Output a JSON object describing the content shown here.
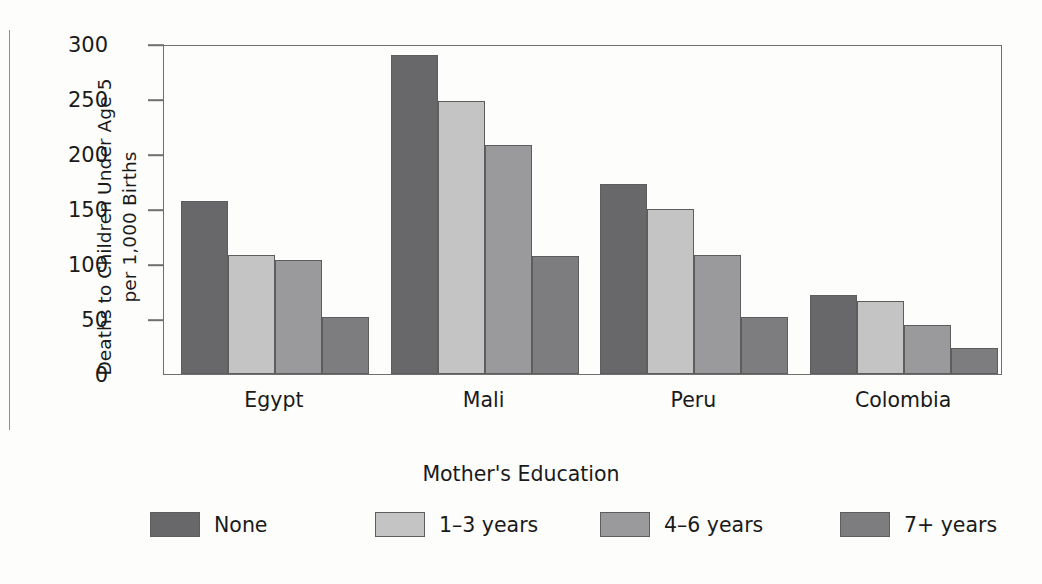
{
  "chart_data": {
    "type": "bar",
    "title": "",
    "xlabel": "Mother's Education",
    "ylabel": "Deaths to Children Under Age 5 per 1,000 Births",
    "ylabel_lines": [
      "Deaths to Children Under Age 5",
      "per 1,000 Births"
    ],
    "categories": [
      "Egypt",
      "Mali",
      "Peru",
      "Colombia"
    ],
    "series": [
      {
        "name": "None",
        "values": [
          157,
          290,
          173,
          72
        ],
        "color": "#68686a"
      },
      {
        "name": "1–3 years",
        "values": [
          108,
          248,
          150,
          66
        ],
        "color": "#c4c4c4"
      },
      {
        "name": "4–6 years",
        "values": [
          104,
          208,
          108,
          45
        ],
        "color": "#9a9a9c"
      },
      {
        "name": "7+ years",
        "values": [
          52,
          107,
          52,
          24
        ],
        "color": "#7d7d7f"
      }
    ],
    "ylim": [
      0,
      300
    ],
    "yticks": [
      0,
      50,
      100,
      150,
      200,
      250,
      300
    ],
    "ytick_labels": [
      "0",
      "50",
      "100",
      "150",
      "200",
      "250",
      "300"
    ],
    "grid": false,
    "legend_position": "bottom",
    "axis_color": "#6f6f6f",
    "bar_edge_color": "#5d5d5d",
    "background": "#fdfdfb"
  },
  "legend": {
    "items": [
      {
        "label": "None"
      },
      {
        "label": "1–3 years"
      },
      {
        "label": "4–6 years"
      },
      {
        "label": "7+ years"
      }
    ]
  }
}
